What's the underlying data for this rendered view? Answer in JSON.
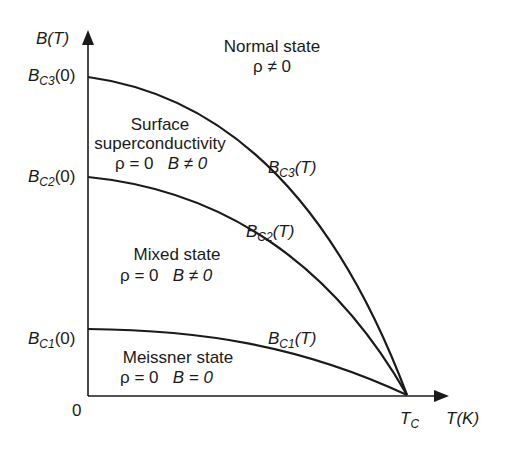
{
  "diagram": {
    "axes": {
      "y_label": "B(T)",
      "x_label": "T(K)",
      "origin": "0",
      "tc": {
        "main": "T",
        "sub": "C"
      }
    },
    "y_ticks": [
      {
        "main": "B",
        "sub": "C3",
        "tail": "(0)"
      },
      {
        "main": "B",
        "sub": "C2",
        "tail": "(0)"
      },
      {
        "main": "B",
        "sub": "C1",
        "tail": "(0)"
      }
    ],
    "curves": [
      {
        "name": "bc3",
        "main": "B",
        "sub": "C3",
        "tail": "(T)"
      },
      {
        "name": "bc2",
        "main": "B",
        "sub": "C2",
        "tail": "(T)"
      },
      {
        "name": "bc1",
        "main": "B",
        "sub": "C1",
        "tail": "(T)"
      }
    ],
    "regions": {
      "normal": {
        "title": "Normal state",
        "cond": "ρ ≠ 0"
      },
      "surface": {
        "title1": "Surface",
        "title2": "superconductivity",
        "cond1": "ρ = 0",
        "cond2": "B ≠ 0"
      },
      "mixed": {
        "title": "Mixed state",
        "cond1": "ρ = 0",
        "cond2": "B ≠ 0"
      },
      "meissner": {
        "title": "Meissner state",
        "cond1": "ρ = 0",
        "cond2": "B = 0"
      }
    },
    "colors": {
      "line": "#1a1a1a",
      "background": "#ffffff"
    }
  }
}
